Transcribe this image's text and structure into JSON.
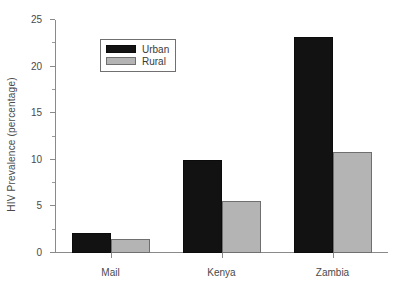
{
  "chart_data": {
    "type": "bar",
    "title": "",
    "xlabel": "",
    "ylabel": "HIV Prevalence (percentage)",
    "categories": [
      "Mail",
      "Kenya",
      "Zambia"
    ],
    "series": [
      {
        "name": "Urban",
        "color": "#121212",
        "values": [
          2.2,
          10.0,
          23.2
        ]
      },
      {
        "name": "Rural",
        "color": "#b4b4b4",
        "values": [
          1.5,
          5.6,
          10.8
        ]
      }
    ],
    "ylim": [
      0,
      25
    ],
    "ytick_labels": [
      "0",
      "5",
      "10",
      "15",
      "20",
      "25"
    ],
    "ytick_values": [
      0,
      5,
      10,
      15,
      20,
      25
    ],
    "yminor_values": [
      2.5,
      7.5,
      12.5,
      17.5,
      22.5
    ],
    "grid": false,
    "legend_position": "upper left",
    "legend_entries": [
      "Urban",
      "Rural"
    ]
  }
}
